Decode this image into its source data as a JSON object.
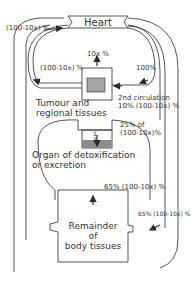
{
  "diagram": {
    "type": "flow",
    "colors": {
      "line": "#2a2a2a",
      "tumour_fill": "#a6a6a6",
      "organ_fill": "#8c8c8c",
      "text": "#333333"
    },
    "nodes": {
      "heart": {
        "label": "Heart"
      },
      "tumour": {
        "label_line1": "Tumour and",
        "label_line2": "regional tissues"
      },
      "organ": {
        "label_line1": "Organ of detoxification",
        "label_line2": "or excretion",
        "fraction_num": "1",
        "fraction_den": "3"
      },
      "remainder": {
        "label_line1": "Remainder",
        "label_line2": "of",
        "label_line3": "body tissues"
      }
    },
    "edges": {
      "outer_left_to_heart": "(100-10x) %",
      "tumour_up": "10x %",
      "tumour_to_left": "(100-10x) %",
      "heart_to_tumour": "100%",
      "second_circulation_line1": "2nd circulation",
      "second_circulation_line2": "10% (100-10x) %",
      "organ_in_line1": "25% of",
      "organ_in_line2": "(100-10x)%",
      "remainder_up": "65% (100-10x) %",
      "remainder_in": "65% (100-10x) %"
    }
  }
}
